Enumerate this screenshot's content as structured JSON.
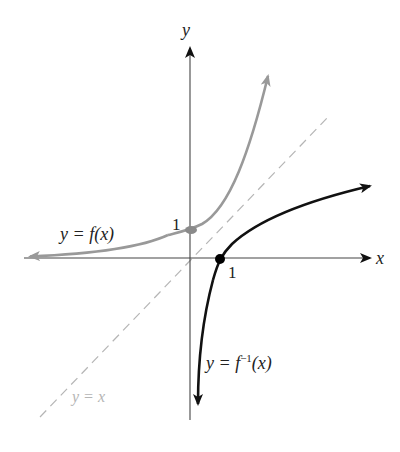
{
  "diagram": {
    "axes": {
      "x_label": "x",
      "y_label": "y"
    },
    "ticks": {
      "x_one": "1",
      "y_one": "1"
    },
    "curves": [
      {
        "name": "f",
        "label": "y = f(x)",
        "color": "#999999",
        "style": "solid"
      },
      {
        "name": "f_inverse",
        "label": "y = f⁻¹(x)",
        "color": "#111111",
        "style": "solid"
      },
      {
        "name": "identity",
        "label": "y = x",
        "color": "#b5b5b5",
        "style": "dashed"
      }
    ],
    "points": [
      {
        "name": "f-intercept",
        "x": 0,
        "y": 1
      },
      {
        "name": "finv-intercept",
        "x": 1,
        "y": 0
      }
    ]
  },
  "labels": {
    "y_axis": "y",
    "x_axis": "x",
    "tick_y1": "1",
    "tick_x1": "1",
    "f_label": "y = f(x)",
    "finv_prefix": "y = f",
    "finv_sup": "−1",
    "finv_suffix": "(x)",
    "identity_label": "y = x"
  }
}
